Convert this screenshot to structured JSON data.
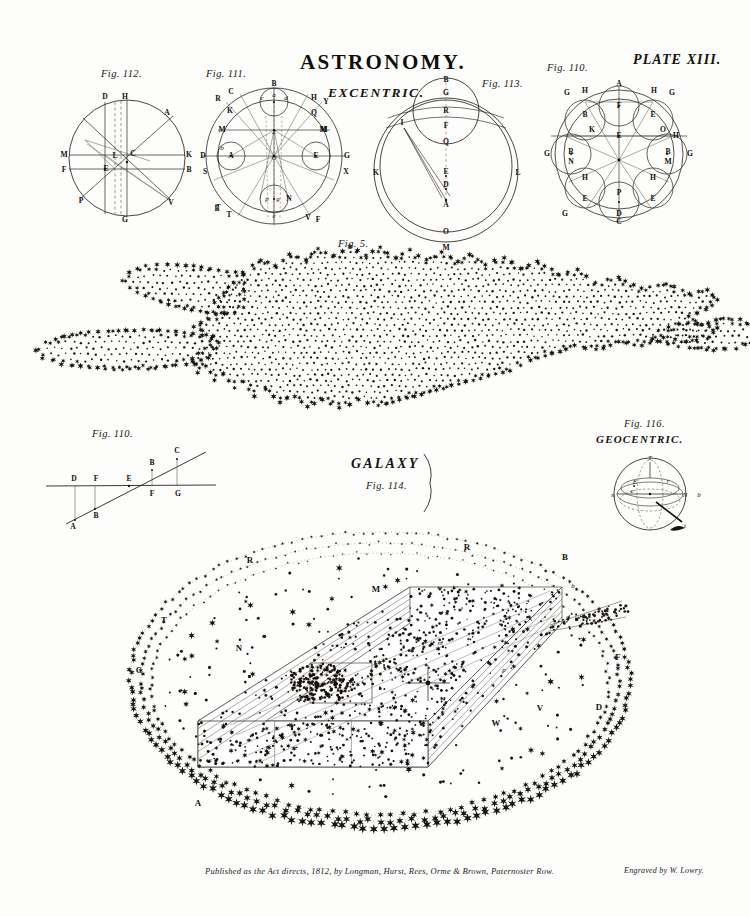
{
  "plate": {
    "title": "ASTRONOMY.",
    "plate_number": "PLATE XIII.",
    "section_excentric": "EXCENTRIC.",
    "section_geocentric": "GEOCENTRIC.",
    "galaxy_word": "GALAXY",
    "imprint": "Published as the Act directs, 1812, by Longman, Hurst, Rees, Orme & Brown, Paternoster Row.",
    "credit": "Engraved by W. Lowry.",
    "ink_color": "#15130f",
    "paper_color": "#fdfdfc"
  },
  "figures": {
    "fig112": {
      "caption": "Fig. 112.",
      "points": [
        "D",
        "H",
        "A",
        "M",
        "L",
        "C",
        "K",
        "F",
        "E",
        "B",
        "P",
        "V",
        "G"
      ]
    },
    "fig111": {
      "caption": "Fig. 111.",
      "points": [
        "B",
        "C",
        "R",
        "K",
        "M",
        "D",
        "S",
        "A",
        "E",
        "M",
        "T",
        "N",
        "G",
        "X",
        "F",
        "V",
        "T",
        "E",
        "H",
        "Y",
        "Q",
        "M",
        "Z",
        "O",
        "c",
        "d",
        "a",
        "b",
        "e",
        "g",
        "p",
        "m"
      ]
    },
    "fig113": {
      "caption": "Fig. 113.",
      "points": [
        "B",
        "G",
        "R",
        "F",
        "Q",
        "I",
        "E",
        "D",
        "A",
        "K",
        "L",
        "O",
        "M"
      ]
    },
    "fig110_top": {
      "caption": "Fig. 110.",
      "points": [
        "A",
        "H",
        "G",
        "F",
        "H",
        "G",
        "B",
        "E",
        "K",
        "E",
        "O",
        "H",
        "B",
        "M",
        "G",
        "R",
        "N",
        "G",
        "H",
        "H",
        "E",
        "E",
        "G",
        "P",
        "D",
        "C"
      ]
    },
    "fig5": {
      "caption": "Fig. 5."
    },
    "fig110_bottom": {
      "caption": "Fig. 110.",
      "points": [
        "D",
        "F",
        "E",
        "F",
        "G",
        "A",
        "B",
        "B",
        "C"
      ]
    },
    "fig116": {
      "caption": "Fig. 116.",
      "points": [
        "T",
        "n",
        "N",
        "b",
        "t",
        "E",
        "e",
        "r"
      ]
    },
    "fig114": {
      "caption": "Fig. 114.",
      "points": [
        "B",
        "R",
        "R",
        "M",
        "T",
        "N",
        "C",
        "A",
        "F",
        "D",
        "V",
        "W",
        "a",
        "b",
        "d",
        "m",
        "p"
      ]
    }
  }
}
